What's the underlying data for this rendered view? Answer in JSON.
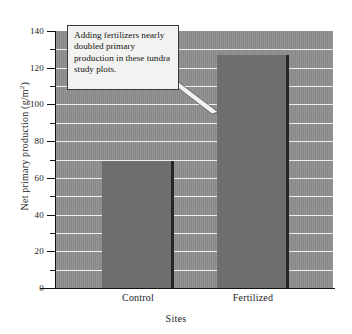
{
  "chart_data": {
    "type": "bar",
    "title": "",
    "categories": [
      "Control",
      "Fertilized"
    ],
    "values": [
      69,
      127
    ],
    "series": [
      {
        "name": "Net primary production",
        "values": [
          69,
          127
        ]
      }
    ],
    "xlabel": "Sites",
    "ylabel": "Net primary production (g/m",
    "ylabel_sup": "2",
    "ylabel_suffix": ")",
    "ylim": [
      0,
      140
    ],
    "ytick_labels": [
      "0",
      "20",
      "40",
      "60",
      "80",
      "100",
      "120",
      "140"
    ],
    "ytick_values": [
      0,
      20,
      40,
      60,
      80,
      100,
      120,
      140
    ],
    "minor_tick_values": [
      10,
      30,
      50,
      70,
      90,
      110,
      130
    ],
    "gridline_values": [
      10,
      20,
      30,
      40,
      50,
      60,
      70,
      80,
      90,
      100,
      110,
      120,
      130
    ],
    "grid": true,
    "legend": "none",
    "annotation": "Adding fertilizers nearly doubled primary production in these tundra study plots.",
    "annotation_target": "Fertilized",
    "colors": {
      "plot_background": "#8e8e8e",
      "bar_fill": "#6e6e6e",
      "bar_edge": "#262626",
      "gridline": "#efefef",
      "axis": "#111111",
      "callout_background": "#f2f2f0",
      "callout_border": "#3a3a3a",
      "text": "#1c1c1c"
    }
  }
}
